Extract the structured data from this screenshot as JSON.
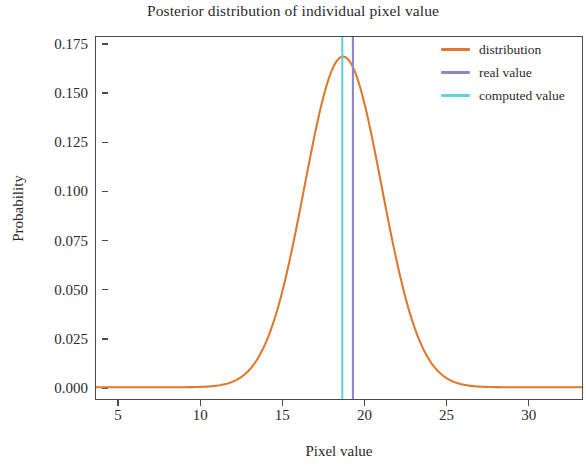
{
  "chart_data": {
    "type": "line",
    "title": "Posterior distribution of individual pixel value",
    "xlabel": "Pixel value",
    "ylabel": "Probability",
    "xlim": [
      3.6,
      33.3
    ],
    "ylim": [
      -0.006,
      0.179
    ],
    "grid": false,
    "legend_position": "upper right",
    "xticks": [
      5,
      10,
      15,
      20,
      25,
      30
    ],
    "xtick_labels": [
      "5",
      "10",
      "15",
      "20",
      "25",
      "30"
    ],
    "yticks": [
      0.0,
      0.025,
      0.05,
      0.075,
      0.1,
      0.125,
      0.15,
      0.175
    ],
    "ytick_labels": [
      "0.000",
      "0.025",
      "0.050",
      "0.075",
      "0.100",
      "0.125",
      "0.150",
      "0.175"
    ],
    "series": [
      {
        "name": "distribution",
        "type": "line",
        "color": "#e0782f",
        "distribution": "gaussian",
        "mean": 18.7,
        "sigma": 2.36,
        "peak_probability": 0.169,
        "x": [
          4.0,
          5.0,
          6.0,
          7.0,
          8.0,
          9.0,
          10.0,
          11.0,
          12.0,
          13.0,
          14.0,
          15.0,
          16.0,
          17.0,
          18.0,
          18.7,
          19.0,
          20.0,
          21.0,
          22.0,
          23.0,
          24.0,
          25.0,
          26.0,
          27.0,
          28.0,
          29.0,
          30.0,
          31.0,
          32.0,
          33.0
        ],
        "y": [
          0.0,
          0.0,
          0.0,
          0.0,
          0.0,
          0.0,
          0.0001,
          0.0007,
          0.0033,
          0.0118,
          0.0327,
          0.0707,
          0.1191,
          0.1565,
          0.1602,
          0.169,
          0.1672,
          0.1342,
          0.0839,
          0.0409,
          0.0155,
          0.0046,
          0.0011,
          0.0002,
          0.0,
          0.0,
          0.0,
          0.0,
          0.0,
          0.0,
          0.0
        ]
      },
      {
        "name": "real value",
        "type": "vline",
        "color": "#8d86c9",
        "x": 19.3
      },
      {
        "name": "computed value",
        "type": "vline",
        "color": "#5fd4da",
        "x": 18.65
      }
    ]
  },
  "legend": {
    "entries": [
      {
        "label": "distribution",
        "color": "#e0782f"
      },
      {
        "label": "real value",
        "color": "#8d86c9"
      },
      {
        "label": "computed value",
        "color": "#5fd4da"
      }
    ]
  }
}
